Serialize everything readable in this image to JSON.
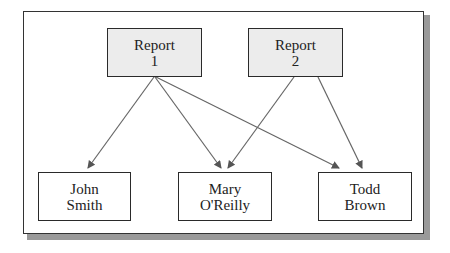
{
  "diagram": {
    "reports": [
      {
        "line1": "Report",
        "line2": "1"
      },
      {
        "line1": "Report",
        "line2": "2"
      }
    ],
    "people": [
      {
        "line1": "John",
        "line2": "Smith"
      },
      {
        "line1": "Mary",
        "line2": "O'Reilly"
      },
      {
        "line1": "Todd",
        "line2": "Brown"
      }
    ],
    "edges": [
      {
        "from": "Report 1",
        "to": "John Smith"
      },
      {
        "from": "Report 1",
        "to": "Mary O'Reilly"
      },
      {
        "from": "Report 1",
        "to": "Todd Brown"
      },
      {
        "from": "Report 2",
        "to": "Mary O'Reilly"
      },
      {
        "from": "Report 2",
        "to": "Todd Brown"
      }
    ],
    "colors": {
      "report_fill": "#ececec",
      "person_fill": "#ffffff",
      "stroke": "#2a2a2a",
      "arrow": "#555555"
    }
  }
}
